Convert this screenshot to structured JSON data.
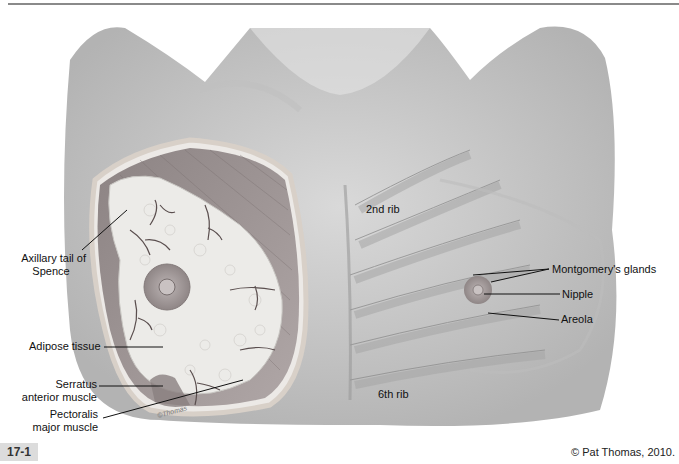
{
  "figure": {
    "number": "17-1",
    "credit": "© Pat Thomas, 2010.",
    "signature": "©Thomas"
  },
  "labels": {
    "axillary_tail": [
      "Axillary tail of",
      "Spence"
    ],
    "adipose": "Adipose tissue",
    "serratus": [
      "Serratus",
      "anterior muscle"
    ],
    "pectoralis": [
      "Pectoralis",
      "major muscle"
    ],
    "rib2": "2nd rib",
    "rib6": "6th rib",
    "montgomery": "Montgomery's glands",
    "nipple": "Nipple",
    "areola": "Areola"
  },
  "colors": {
    "skin": "#cfcfcf",
    "muscle": "#9a8f8f",
    "adipose": "#e9e9e6",
    "areola": "#a8a2a2",
    "label_text": "#111111",
    "figure_badge": "#dcdcdc"
  }
}
